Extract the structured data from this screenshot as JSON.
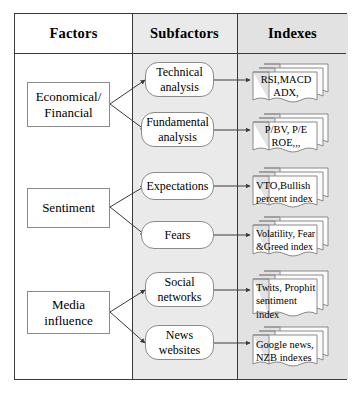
{
  "diagram": {
    "columns": [
      {
        "id": "factors",
        "label": "Factors"
      },
      {
        "id": "subfactors",
        "label": "Subfactors"
      },
      {
        "id": "indexes",
        "label": "Indexes"
      }
    ],
    "colors": {
      "factors_background": "#ffffff",
      "subfactors_background": "#eaeaea",
      "indexes_background": "#e2e2e2",
      "border": "#3a3a3a",
      "shape_border": "#8b8b8b",
      "shape_fill": "#ffffff"
    },
    "factors": [
      {
        "id": "economical-financial",
        "label": "Economical/\nFinancial"
      },
      {
        "id": "sentiment",
        "label": "Sentiment"
      },
      {
        "id": "media-influence",
        "label": "Media\ninfluence"
      }
    ],
    "subfactors": [
      {
        "id": "technical-analysis",
        "label": "Technical\nanalysis",
        "parent": "economical-financial"
      },
      {
        "id": "fundamental-analysis",
        "label": "Fundamental\nanalysis",
        "parent": "economical-financial"
      },
      {
        "id": "expectations",
        "label": "Expectations",
        "parent": "sentiment"
      },
      {
        "id": "fears",
        "label": "Fears",
        "parent": "sentiment"
      },
      {
        "id": "social-networks",
        "label": "Social\nnetworks",
        "parent": "media-influence"
      },
      {
        "id": "news-websites",
        "label": "News\nwebsites",
        "parent": "media-influence"
      }
    ],
    "indexes": [
      {
        "id": "idx-technical",
        "label": "RSI,MACD\nADX,",
        "parent": "technical-analysis"
      },
      {
        "id": "idx-fundamental",
        "label": "P/BV, P/E\nROE,,,",
        "parent": "fundamental-analysis"
      },
      {
        "id": "idx-expectations",
        "label": "VTO,Bullish\npercent index",
        "parent": "expectations"
      },
      {
        "id": "idx-fears",
        "label": "Volatility, Fear\n&Greed index",
        "parent": "fears"
      },
      {
        "id": "idx-social",
        "label": "Twits, Prophit\nsentiment\nindex",
        "parent": "social-networks"
      },
      {
        "id": "idx-news",
        "label": "Google news,\nNZB indexes",
        "parent": "news-websites"
      }
    ]
  }
}
